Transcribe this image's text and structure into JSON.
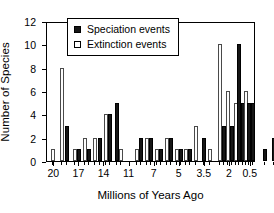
{
  "chart_data": {
    "type": "bar",
    "title": "",
    "xlabel": "Millions of Years Ago",
    "ylabel": "Number of Species",
    "ylim": [
      0,
      12
    ],
    "ytick_labels": [
      "0",
      "2",
      "4",
      "6",
      "8",
      "10",
      "12"
    ],
    "ytick_values": [
      0,
      2,
      4,
      6,
      8,
      10,
      12
    ],
    "xtick_labels": [
      "20",
      "17",
      "14",
      "11",
      "7",
      "5",
      "3.5",
      "2",
      "0.5"
    ],
    "xtick_positions": [
      0.035,
      0.155,
      0.275,
      0.395,
      0.515,
      0.635,
      0.755,
      0.875,
      0.975
    ],
    "grid": false,
    "legend_position": "top-center-left",
    "series": [
      {
        "name": "Speciation events",
        "color": "#161616",
        "style": "filled"
      },
      {
        "name": "Extinction events",
        "color": "#ffffff",
        "style": "open"
      }
    ],
    "bars": [
      {
        "series": "Extinction events",
        "x": 0.028,
        "value": 1
      },
      {
        "series": "Extinction events",
        "x": 0.072,
        "value": 8
      },
      {
        "series": "Speciation events",
        "x": 0.098,
        "value": 3
      },
      {
        "series": "Extinction events",
        "x": 0.133,
        "value": 1
      },
      {
        "series": "Speciation events",
        "x": 0.152,
        "value": 1
      },
      {
        "series": "Extinction events",
        "x": 0.183,
        "value": 2
      },
      {
        "series": "Speciation events",
        "x": 0.203,
        "value": 1
      },
      {
        "series": "Extinction events",
        "x": 0.232,
        "value": 2
      },
      {
        "series": "Speciation events",
        "x": 0.252,
        "value": 2
      },
      {
        "series": "Extinction events",
        "x": 0.281,
        "value": 4
      },
      {
        "series": "Speciation events",
        "x": 0.3,
        "value": 4
      },
      {
        "series": "Speciation events",
        "x": 0.334,
        "value": 5
      },
      {
        "series": "Extinction events",
        "x": 0.354,
        "value": 1
      },
      {
        "series": "Extinction events",
        "x": 0.432,
        "value": 1
      },
      {
        "series": "Speciation events",
        "x": 0.451,
        "value": 2
      },
      {
        "series": "Extinction events",
        "x": 0.479,
        "value": 2
      },
      {
        "series": "Speciation events",
        "x": 0.498,
        "value": 2
      },
      {
        "series": "Extinction events",
        "x": 0.527,
        "value": 1
      },
      {
        "series": "Speciation events",
        "x": 0.546,
        "value": 1
      },
      {
        "series": "Extinction events",
        "x": 0.575,
        "value": 2
      },
      {
        "series": "Speciation events",
        "x": 0.594,
        "value": 2
      },
      {
        "series": "Extinction events",
        "x": 0.623,
        "value": 1
      },
      {
        "series": "Speciation events",
        "x": 0.642,
        "value": 1
      },
      {
        "series": "Extinction events",
        "x": 0.666,
        "value": 1
      },
      {
        "series": "Speciation events",
        "x": 0.685,
        "value": 1
      },
      {
        "series": "Extinction events",
        "x": 0.714,
        "value": 3
      },
      {
        "series": "Speciation events",
        "x": 0.752,
        "value": 2
      },
      {
        "series": "Extinction events",
        "x": 0.781,
        "value": 1
      },
      {
        "series": "Extinction events",
        "x": 0.829,
        "value": 10
      },
      {
        "series": "Speciation events",
        "x": 0.848,
        "value": 3
      },
      {
        "series": "Extinction events",
        "x": 0.867,
        "value": 6
      },
      {
        "series": "Speciation events",
        "x": 0.886,
        "value": 3
      },
      {
        "series": "Extinction events",
        "x": 0.905,
        "value": 5
      },
      {
        "series": "Speciation events",
        "x": 0.919,
        "value": 10
      },
      {
        "series": "Speciation events",
        "x": 0.938,
        "value": 5
      },
      {
        "series": "Extinction events",
        "x": 0.952,
        "value": 6
      },
      {
        "series": "Speciation events",
        "x": 0.966,
        "value": 5
      },
      {
        "series": "Speciation events",
        "x": 0.985,
        "value": 5
      },
      {
        "series": "Speciation events",
        "x": 1.042,
        "value": 1
      },
      {
        "series": "Speciation events",
        "x": 1.085,
        "value": 2
      }
    ]
  },
  "legend": {
    "items": [
      {
        "label": "Speciation events",
        "swatch": "filled-square-icon"
      },
      {
        "label": "Extinction events",
        "swatch": "open-square-icon"
      }
    ]
  },
  "axes": {
    "x_title": "Millions of Years Ago",
    "y_title": "Number of Species"
  }
}
